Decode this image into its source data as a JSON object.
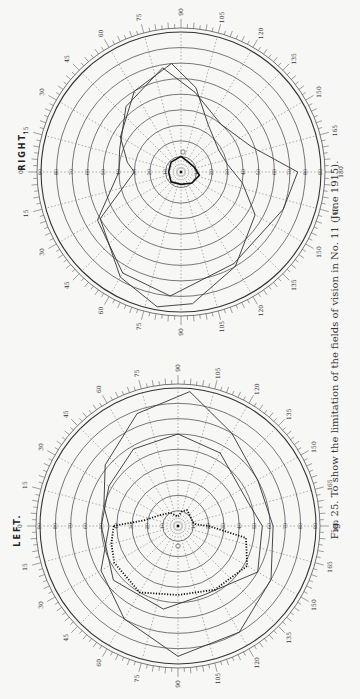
{
  "page": {
    "orientation": "rotated-90",
    "header_fragment": "— cut off —"
  },
  "caption": "Fig. 25.  To show the limitation of the fields of vision in No. 11 (June 1915).",
  "chart_data": [
    {
      "type": "polar-perimeter",
      "title": "RIGHT.",
      "eye": "right",
      "center_px": [
        181,
        172
      ],
      "outer_radius_px": 140,
      "angle_labels_top": [
        "0",
        "15",
        "30",
        "45",
        "60",
        "75",
        "90",
        "105",
        "120",
        "135",
        "150",
        "165",
        "180"
      ],
      "angle_labels_bottom": [
        "15",
        "30",
        "45",
        "60",
        "75",
        "90",
        "105",
        "120",
        "135",
        "150",
        "165"
      ],
      "radial_labels": [
        "90",
        "80",
        "70",
        "60",
        "50",
        "40",
        "30",
        "20",
        "10"
      ],
      "rings_degrees": [
        10,
        20,
        30,
        40,
        50,
        60,
        70,
        80,
        90
      ],
      "series": [
        {
          "name": "outer field boundary (large loop)",
          "style": "thin line",
          "points_deg": [
            [
              0,
              30
            ],
            [
              30,
              60
            ],
            [
              60,
              78
            ],
            [
              80,
              88
            ],
            [
              95,
              85
            ],
            [
              120,
              70
            ],
            [
              150,
              55
            ],
            [
              170,
              40
            ],
            [
              190,
              30
            ],
            [
              210,
              28
            ],
            [
              240,
              35
            ],
            [
              260,
              55
            ],
            [
              275,
              70
            ],
            [
              300,
              60
            ],
            [
              330,
              45
            ],
            [
              350,
              35
            ]
          ]
        },
        {
          "name": "second field boundary",
          "style": "thin line",
          "points_deg": [
            [
              0,
              40
            ],
            [
              30,
              62
            ],
            [
              60,
              75
            ],
            [
              85,
              80
            ],
            [
              120,
              68
            ],
            [
              160,
              70
            ],
            [
              180,
              75
            ],
            [
              200,
              48
            ],
            [
              230,
              40
            ],
            [
              260,
              52
            ],
            [
              280,
              68
            ],
            [
              310,
              55
            ],
            [
              340,
              42
            ]
          ]
        },
        {
          "name": "restricted central field",
          "style": "thick line",
          "points_deg": [
            [
              0,
              8
            ],
            [
              45,
              9
            ],
            [
              90,
              8
            ],
            [
              135,
              10
            ],
            [
              170,
              12
            ],
            [
              200,
              9
            ],
            [
              240,
              8
            ],
            [
              270,
              10
            ],
            [
              315,
              9
            ]
          ]
        }
      ],
      "markers": [
        {
          "label": "blind spot",
          "angle": 90,
          "radius": 15
        }
      ]
    },
    {
      "type": "polar-perimeter",
      "title": "LEFT.",
      "eye": "left",
      "center_px": [
        178,
        526
      ],
      "outer_radius_px": 138,
      "angle_labels_top": [
        "0",
        "15",
        "30",
        "45",
        "60",
        "75",
        "90",
        "105",
        "120",
        "135",
        "150",
        "165",
        "180"
      ],
      "angle_labels_bottom": [
        "15",
        "30",
        "45",
        "60",
        "75",
        "90",
        "105",
        "120",
        "135",
        "150",
        "165"
      ],
      "radial_labels": [
        "90",
        "80",
        "70",
        "60",
        "50",
        "40",
        "30",
        "20",
        "10"
      ],
      "rings_degrees": [
        10,
        20,
        30,
        40,
        50,
        60,
        70,
        80,
        90
      ],
      "series": [
        {
          "name": "outer field boundary (large loop)",
          "style": "thin line",
          "points_deg": [
            [
              0,
              45
            ],
            [
              30,
              58
            ],
            [
              60,
              70
            ],
            [
              90,
              85
            ],
            [
              120,
              80
            ],
            [
              150,
              70
            ],
            [
              180,
              62
            ],
            [
              210,
              60
            ],
            [
              240,
              70
            ],
            [
              265,
              88
            ],
            [
              290,
              78
            ],
            [
              320,
              62
            ],
            [
              345,
              50
            ]
          ]
        },
        {
          "name": "second field boundary",
          "style": "thin line",
          "points_deg": [
            [
              0,
              50
            ],
            [
              40,
              55
            ],
            [
              80,
              55
            ],
            [
              110,
              48
            ],
            [
              150,
              60
            ],
            [
              180,
              55
            ],
            [
              200,
              48
            ],
            [
              240,
              55
            ],
            [
              270,
              60
            ],
            [
              300,
              58
            ],
            [
              330,
              52
            ]
          ]
        },
        {
          "name": "limited field (dotted)",
          "style": "dotted line",
          "points_deg": [
            [
              0,
              42
            ],
            [
              15,
              45
            ],
            [
              30,
              48
            ],
            [
              60,
              50
            ],
            [
              90,
              45
            ],
            [
              120,
              48
            ],
            [
              150,
              52
            ],
            [
              170,
              45
            ],
            [
              180,
              20
            ],
            [
              185,
              12
            ],
            [
              195,
              10
            ],
            [
              215,
              10
            ],
            [
              240,
              12
            ],
            [
              255,
              10
            ],
            [
              270,
              6
            ],
            [
              300,
              10
            ],
            [
              330,
              14
            ],
            [
              350,
              22
            ],
            [
              360,
              42
            ]
          ]
        }
      ],
      "markers": [
        {
          "label": "blind spot",
          "angle": 90,
          "radius": 15
        }
      ]
    }
  ]
}
